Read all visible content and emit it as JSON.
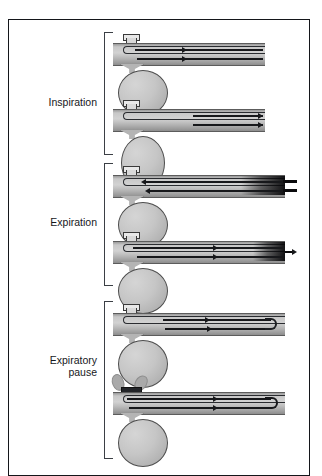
{
  "figure": {
    "frame": {
      "border_color": "#14161a"
    },
    "background": "#ffffff"
  },
  "phases": [
    {
      "id": "inspiration",
      "label": "Inspiration",
      "bracket": {
        "top": 31,
        "height": 123
      },
      "label_top": 96,
      "panels": [
        "panel-1",
        "panel-2"
      ]
    },
    {
      "id": "expiration",
      "label": "Expiration",
      "bracket": {
        "top": 162,
        "height": 123
      },
      "label_top": 216,
      "panels": [
        "panel-3",
        "panel-4"
      ]
    },
    {
      "id": "expiratory-pause",
      "label": "Expiratory\npause",
      "bracket": {
        "top": 300,
        "height": 158
      },
      "label_top": 360,
      "panels": [
        "panel-5",
        "panel-6"
      ]
    }
  ],
  "panels": [
    {
      "id": "panel-1",
      "phase": "inspiration",
      "description": "Inspiration start: fresh gas flows in, arrows point right, lung balloon round",
      "flow_direction": "right",
      "tube_length": 152,
      "balloon": {
        "shape": "round",
        "width": 48,
        "height": 46
      },
      "arrows": [
        {
          "direction": "right",
          "lane": "upper"
        },
        {
          "direction": "right",
          "lane": "lower"
        }
      ],
      "right_end": "open",
      "valve_state": "open"
    },
    {
      "id": "panel-2",
      "phase": "inspiration",
      "description": "Inspiration end: flow continues right, lung balloon elongated (inflated)",
      "flow_direction": "right",
      "tube_length": 152,
      "balloon": {
        "shape": "oval",
        "width": 42,
        "height": 52
      },
      "arrows": [
        {
          "direction": "right",
          "lane": "upper"
        },
        {
          "direction": "right",
          "lane": "lower"
        }
      ],
      "right_end": "open",
      "valve_state": "open"
    },
    {
      "id": "panel-3",
      "phase": "expiration",
      "description": "Expiration start: gas flows left out of lung; dense dark gas front exits at right end",
      "flow_direction": "left",
      "tube_length": 172,
      "balloon": {
        "shape": "round",
        "width": 48,
        "height": 46
      },
      "arrows": [
        {
          "direction": "left",
          "lane": "upper"
        },
        {
          "direction": "left",
          "lane": "lower"
        }
      ],
      "right_end": "dense-exit",
      "valve_state": "open"
    },
    {
      "id": "panel-4",
      "phase": "expiration",
      "description": "Expiration end: flow reverses to right, dense gas column pushed to right end with small exit arrow",
      "flow_direction": "right",
      "tube_length": 172,
      "balloon": {
        "shape": "round",
        "width": 48,
        "height": 46
      },
      "arrows": [
        {
          "direction": "right",
          "lane": "upper"
        },
        {
          "direction": "right",
          "lane": "lower"
        }
      ],
      "right_end": "exit-arrow",
      "valve_state": "open"
    },
    {
      "id": "panel-5",
      "phase": "expiratory-pause",
      "description": "Expiratory pause: gas recirculates, U-turn loop at right end, lung balloon round",
      "flow_direction": "right",
      "tube_length": 172,
      "balloon": {
        "shape": "round",
        "width": 48,
        "height": 48
      },
      "arrows": [
        {
          "direction": "right",
          "lane": "upper"
        },
        {
          "direction": "right",
          "lane": "lower"
        }
      ],
      "right_end": "u-turn",
      "valve_state": "open"
    },
    {
      "id": "panel-6",
      "phase": "expiratory-pause",
      "description": "Expiratory pause with occluded valve: gas puffs escape at the valve, dark U-turn at right end",
      "flow_direction": "right",
      "tube_length": 172,
      "balloon": {
        "shape": "round",
        "width": 48,
        "height": 48
      },
      "arrows": [
        {
          "direction": "right",
          "lane": "upper"
        },
        {
          "direction": "right",
          "lane": "lower"
        }
      ],
      "right_end": "u-turn-dark",
      "valve_state": "occluded",
      "puffs": 2
    }
  ],
  "colors": {
    "frame": "#14161a",
    "tube_fill": "#c8c8c8",
    "tube_outline": "#5c5c5c",
    "balloon_fill": "#c6c6c6",
    "balloon_outline": "#4c4c4c",
    "flow_line": "#17181b",
    "dense_gas": "#0a0a0c",
    "puff": "#a9a9a9",
    "label_text": "#16181c"
  }
}
